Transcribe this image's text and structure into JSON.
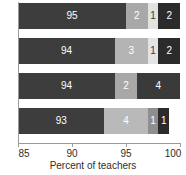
{
  "chart_data": {
    "type": "bar",
    "orientation": "horizontal",
    "stacked": true,
    "title": "",
    "xlabel": "Percent of teachers",
    "ylabel": "",
    "xlim": [
      85,
      100
    ],
    "xticks": [
      85,
      90,
      95,
      100
    ],
    "xtick_labels": [
      "85",
      "90",
      "95",
      "100"
    ],
    "grid": false,
    "legend": "none",
    "categories": [
      "bar-1",
      "bar-2",
      "bar-3",
      "bar-4"
    ],
    "series": [
      {
        "name": "series-1",
        "color": "#3d3d3d",
        "values": [
          95,
          94,
          94,
          93
        ]
      },
      {
        "name": "series-2",
        "color": "#a8a8a8",
        "values": [
          2,
          3,
          2,
          4
        ]
      },
      {
        "name": "series-3",
        "color": "#e2e2e2",
        "values": [
          1,
          1,
          0,
          1
        ]
      },
      {
        "name": "series-4",
        "color": "#2b2b2b",
        "values": [
          2,
          2,
          4,
          1
        ]
      }
    ],
    "bars": [
      {
        "name": "bar-1",
        "segments": [
          {
            "value": 95,
            "label": "95",
            "color": "#3d3d3d",
            "text_color": "light"
          },
          {
            "value": 2,
            "label": "2",
            "color": "#a8a8a8",
            "text_color": "light"
          },
          {
            "value": 1,
            "label": "1",
            "color": "#e2e2e2",
            "text_color": "dark"
          },
          {
            "value": 2,
            "label": "2",
            "color": "#2b2b2b",
            "text_color": "light"
          }
        ]
      },
      {
        "name": "bar-2",
        "segments": [
          {
            "value": 94,
            "label": "94",
            "color": "#3d3d3d",
            "text_color": "light"
          },
          {
            "value": 3,
            "label": "3",
            "color": "#b4b4b4",
            "text_color": "light"
          },
          {
            "value": 1,
            "label": "1",
            "color": "#e4e4e4",
            "text_color": "dark"
          },
          {
            "value": 2,
            "label": "2",
            "color": "#2b2b2b",
            "text_color": "light"
          }
        ]
      },
      {
        "name": "bar-3",
        "segments": [
          {
            "value": 94,
            "label": "94",
            "color": "#3d3d3d",
            "text_color": "light"
          },
          {
            "value": 2,
            "label": "2",
            "color": "#a8a8a8",
            "text_color": "light"
          },
          {
            "value": 4,
            "label": "4",
            "color": "#3a3a3a",
            "text_color": "light"
          }
        ]
      },
      {
        "name": "bar-4",
        "segments": [
          {
            "value": 93,
            "label": "93",
            "color": "#3d3d3d",
            "text_color": "light"
          },
          {
            "value": 4,
            "label": "4",
            "color": "#b9b9b9",
            "text_color": "light"
          },
          {
            "value": 1,
            "label": "1",
            "color": "#8e8e8e",
            "text_color": "light"
          },
          {
            "value": 1,
            "label": "1",
            "color": "#2b2b2b",
            "text_color": "light"
          }
        ]
      }
    ]
  }
}
